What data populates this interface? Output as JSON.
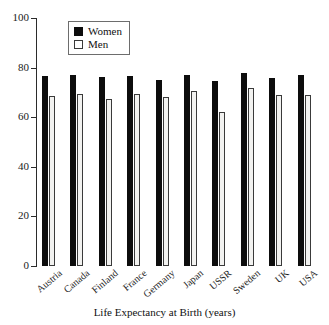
{
  "chart_data": {
    "type": "bar",
    "title": "",
    "xlabel": "Life Expectancy at Birth (years)",
    "ylabel": "",
    "categories": [
      "Austria",
      "Canada",
      "Finland",
      "France",
      "Germany",
      "Japan",
      "USSR",
      "Sweden",
      "UK",
      "USA"
    ],
    "series": [
      {
        "name": "Women",
        "color": "#0d0d0d",
        "values": [
          76.5,
          77.0,
          76.3,
          76.8,
          75.2,
          77.0,
          74.8,
          77.8,
          75.9,
          76.9
        ]
      },
      {
        "name": "Men",
        "color": "#f2f2f0",
        "values": [
          68.5,
          69.2,
          67.2,
          69.2,
          68.2,
          70.6,
          62.0,
          71.6,
          68.8,
          68.8
        ]
      }
    ],
    "ylim": [
      0,
      100
    ],
    "yticks": [
      0,
      20,
      40,
      60,
      80,
      100
    ],
    "ytick_labels": [
      "0",
      "20",
      "40",
      "60",
      "80",
      "100"
    ],
    "grid": false,
    "legend_position": "top-left-inside"
  },
  "legend": {
    "items": [
      {
        "label": "Women",
        "swatch": "filled-black-square"
      },
      {
        "label": "Men",
        "swatch": "open-white-square"
      }
    ]
  }
}
